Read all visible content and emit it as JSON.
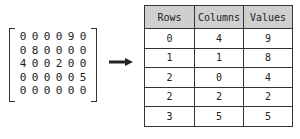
{
  "matrix": {
    "rows": [
      [
        "0",
        "0",
        "0",
        "0",
        "9",
        "0"
      ],
      [
        "0",
        "8",
        "0",
        "0",
        "0",
        "0"
      ],
      [
        "4",
        "0",
        "0",
        "2",
        "0",
        "0"
      ],
      [
        "0",
        "0",
        "0",
        "0",
        "0",
        "5"
      ],
      [
        "0",
        "0",
        "0",
        "0",
        "0",
        "0"
      ]
    ]
  },
  "arrow": {
    "icon": "right-arrow-icon"
  },
  "table": {
    "headers": [
      "Rows",
      "Columns",
      "Values"
    ],
    "rows": [
      [
        "0",
        "4",
        "9"
      ],
      [
        "1",
        "1",
        "8"
      ],
      [
        "2",
        "0",
        "4"
      ],
      [
        "2",
        "2",
        "2"
      ],
      [
        "3",
        "5",
        "5"
      ]
    ]
  }
}
